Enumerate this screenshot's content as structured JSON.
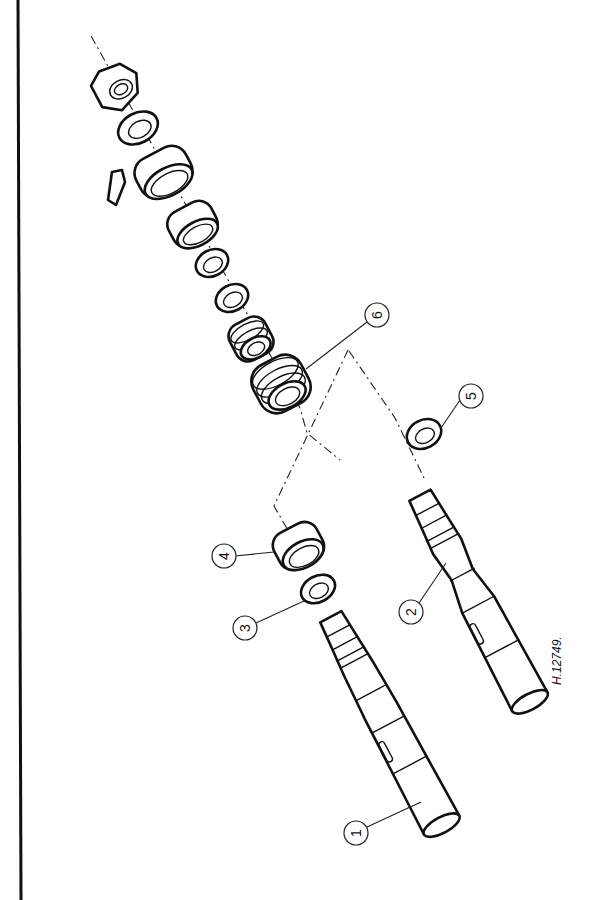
{
  "figure": {
    "reference_code": "H.12749.",
    "callouts": [
      {
        "id": "1",
        "label": "1",
        "x": 356,
        "y": 833
      },
      {
        "id": "2",
        "label": "2",
        "x": 411,
        "y": 612
      },
      {
        "id": "3",
        "label": "3",
        "x": 245,
        "y": 628
      },
      {
        "id": "4",
        "label": "4",
        "x": 224,
        "y": 556
      },
      {
        "id": "5",
        "label": "5",
        "x": 471,
        "y": 396
      },
      {
        "id": "6",
        "label": "6",
        "x": 377,
        "y": 315
      }
    ],
    "colors": {
      "line": "#111111",
      "background": "#ffffff"
    }
  }
}
